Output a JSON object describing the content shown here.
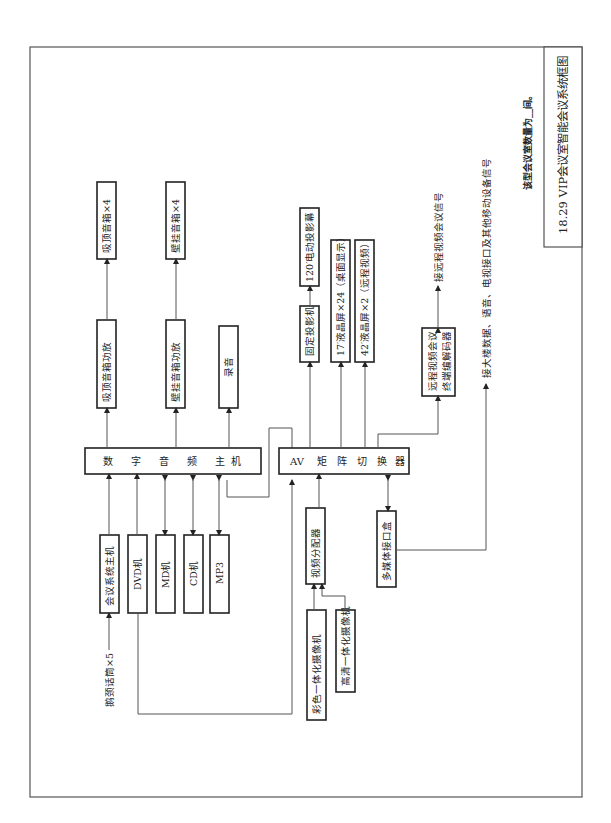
{
  "figure": {
    "title": "18.29  VIP会议室智能会议系统框图",
    "note": "该型会议室数量为__间。"
  },
  "nodes": {
    "audio_host": "数 字 音 频 主 机",
    "av_matrix": "AV 矩 阵 切 换 器",
    "ceiling_amp": "吸顶音箱功放",
    "ceiling_spk": "吸顶音箱×4",
    "wall_amp": "壁挂音箱功放",
    "wall_spk": "壁挂音箱×4",
    "record": "录音",
    "projector": "固定投影机",
    "screen": "120′电动投影幕",
    "lcd17": "17′液晶屏×24（桌面显示）",
    "lcd42": "42′液晶屏×2（远程视频）",
    "codec_line1": "远程视频会议",
    "codec_line2": "终端编解码器",
    "conf_host": "会议系统主机",
    "dvd": "DVD机",
    "md": "MD机",
    "cd": "CD机",
    "mp3": "MP3",
    "video_dist": "视频分配器",
    "media_box": "多媒体接口盒",
    "color_cam": "彩色一体化摄像机",
    "hd_cam": "高清一体化摄像机"
  },
  "labels": {
    "mic": "鹅颈话筒×5",
    "remote_signal": "接远程视频会议信号",
    "building_signal": "接大楼数据、语音、电视接口及其他移动设备信号"
  }
}
